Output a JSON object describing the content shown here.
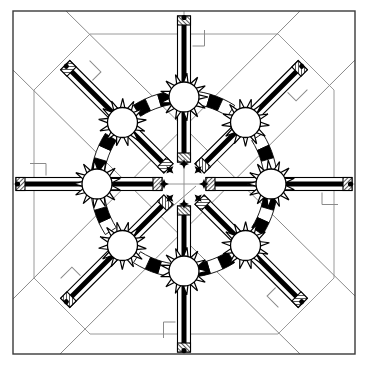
{
  "figure": {
    "kind": "technical-line-drawing",
    "canvas": {
      "width": 367,
      "height": 369,
      "background": "#ffffff"
    },
    "colors": {
      "ink": "#000000",
      "construction_line": "#8a8a8a",
      "frame": "#3a3a3a",
      "fill_white": "#ffffff",
      "hatch": "#000000"
    }
  },
  "frame": {
    "name": "outer-border-square",
    "x": 13,
    "y": 11,
    "width": 342,
    "height": 343,
    "stroke": "#3a3a3a",
    "stroke_width": 1.4,
    "fill": "none"
  },
  "construction": {
    "octagon": {
      "name": "background-octagon",
      "center": [
        184,
        184
      ],
      "circumradius": 150,
      "cut": 56,
      "stroke": "#9a9a9a",
      "stroke_width": 1
    },
    "diagonals": [
      {
        "name": "diagonal-nw-se",
        "x1": 13,
        "y1": 299,
        "x2": 300,
        "y2": 11
      },
      {
        "name": "diagonal-sw-ne",
        "x1": 60,
        "y1": 354,
        "x2": 355,
        "y2": 60
      },
      {
        "name": "diagonal-ne-sw",
        "x1": 13,
        "y1": 70,
        "x2": 300,
        "y2": 354
      },
      {
        "name": "diagonal-se-nw",
        "x1": 66,
        "y1": 11,
        "x2": 355,
        "y2": 296
      }
    ],
    "axes": [
      {
        "name": "axis-vertical",
        "x1": 184,
        "y1": 11,
        "x2": 184,
        "y2": 354
      },
      {
        "name": "axis-horizontal",
        "x1": 13,
        "y1": 184,
        "x2": 355,
        "y2": 184
      }
    ],
    "center_tick": {
      "name": "center-leader-line",
      "x1": 120,
      "y1": 252,
      "x2": 196,
      "y2": 186
    }
  },
  "ring": {
    "name": "segmented-ring",
    "center": [
      184,
      184
    ],
    "radius": 87,
    "band_width": 13,
    "segments": 44,
    "segment_fill_on": "#000000",
    "segment_fill_off": "#ffffff",
    "stroke": "#000000"
  },
  "hubs": {
    "name": "starburst-hubs",
    "count": 8,
    "teeth": 13,
    "core_radius": 15,
    "tooth_length": 9,
    "ring_radius": 87,
    "core_fill": "#ffffff",
    "tooth_fill": "#ffffff",
    "stroke": "#000000",
    "angles_deg": [
      270,
      315,
      0,
      45,
      90,
      135,
      180,
      225
    ],
    "labels": [
      "hub-north",
      "hub-northeast",
      "hub-east",
      "hub-southeast",
      "hub-south",
      "hub-southwest",
      "hub-west",
      "hub-northwest"
    ]
  },
  "spokes": {
    "name": "spoke-arms",
    "count": 8,
    "inner_end_radius": 22,
    "outer_end_radius": 168,
    "arm_width": 13,
    "core_bar_width": 5,
    "core_fill": "#000000",
    "body_fill": "#ffffff",
    "stroke": "#000000",
    "cap": {
      "name": "hatched-end-cap",
      "length": 9,
      "hatch_spacing": 2.2
    },
    "arrow_marker": {
      "name": "inner-arrow-marker",
      "size": 5
    },
    "leaders": [
      {
        "name": "leader-north",
        "angle_deg": 270
      },
      {
        "name": "leader-northeast",
        "angle_deg": 315
      },
      {
        "name": "leader-east",
        "angle_deg": 0
      },
      {
        "name": "leader-southeast",
        "angle_deg": 45
      },
      {
        "name": "leader-south",
        "angle_deg": 90
      },
      {
        "name": "leader-southwest",
        "angle_deg": 135
      },
      {
        "name": "leader-west",
        "angle_deg": 180
      },
      {
        "name": "leader-northwest",
        "angle_deg": 225
      }
    ]
  }
}
